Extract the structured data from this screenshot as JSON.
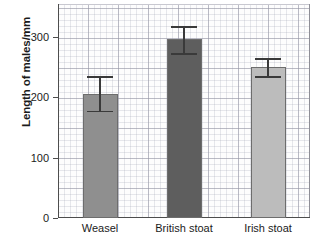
{
  "chart_data": {
    "type": "bar",
    "title": "",
    "xlabel": "",
    "ylabel": "Length of males/mm",
    "categories": [
      "Weasel",
      "British stoat",
      "Irish stoat"
    ],
    "values": [
      205,
      297,
      250
    ],
    "errors_low": [
      175,
      270,
      232
    ],
    "errors_high": [
      235,
      318,
      265
    ],
    "bar_colors": [
      "#8f8f8f",
      "#5e5e5e",
      "#bcbcbc"
    ],
    "ylim": [
      0,
      355
    ],
    "yticks": [
      0,
      100,
      200,
      300
    ],
    "ytick_labels": [
      "0",
      "100",
      "200",
      "300"
    ],
    "grid": true,
    "grid_style": "graph-paper",
    "legend": "none",
    "error_bar_style": "capped-vertical"
  },
  "axis": {
    "y_title": "Length of males/mm"
  }
}
